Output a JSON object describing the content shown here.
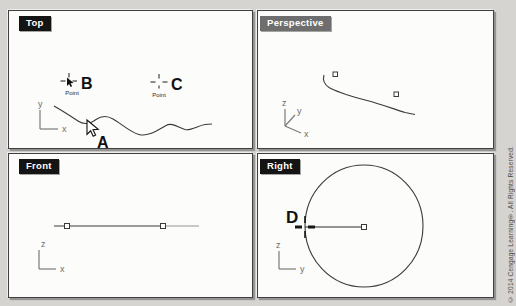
{
  "viewports": [
    {
      "title": "Top",
      "axes": {
        "v": "y",
        "h": "x"
      }
    },
    {
      "title": "Perspective",
      "axes": {
        "v": "z",
        "d": "y",
        "h": "x"
      }
    },
    {
      "title": "Front",
      "axes": {
        "v": "z",
        "h": "x"
      }
    },
    {
      "title": "Right",
      "axes": {
        "v": "z",
        "h": "y"
      }
    }
  ],
  "annotations": {
    "a": "A",
    "b": "B",
    "c": "C",
    "d": "D"
  },
  "tooltips": {
    "point": "Point"
  },
  "copyright": "© 2014 Cengage Learning®. All Rights Reserved.",
  "colors": {
    "background": "#d6d4d1",
    "viewport_bg": "#fcfcfa",
    "title_bg": "#141414",
    "title_active_bg": "#6e6e6e",
    "title_text": "#ffffff",
    "geometry": "#3a3a3a",
    "axis": "#7a7a7a",
    "faded_line": "#949494"
  }
}
